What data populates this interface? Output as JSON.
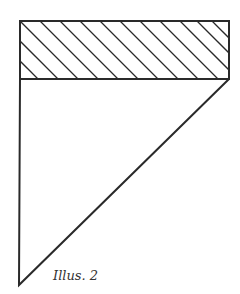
{
  "figure": {
    "caption": "Illus. 2",
    "stroke_color": "#2a2a2a",
    "background": "#ffffff",
    "hatched_rectangle": {
      "x": 20,
      "y": 21,
      "width": 209,
      "height": 58,
      "hatch": "diagonal-lines"
    },
    "triangle": {
      "points": [
        [
          20,
          79
        ],
        [
          229,
          79
        ],
        [
          19,
          285
        ]
      ]
    }
  }
}
